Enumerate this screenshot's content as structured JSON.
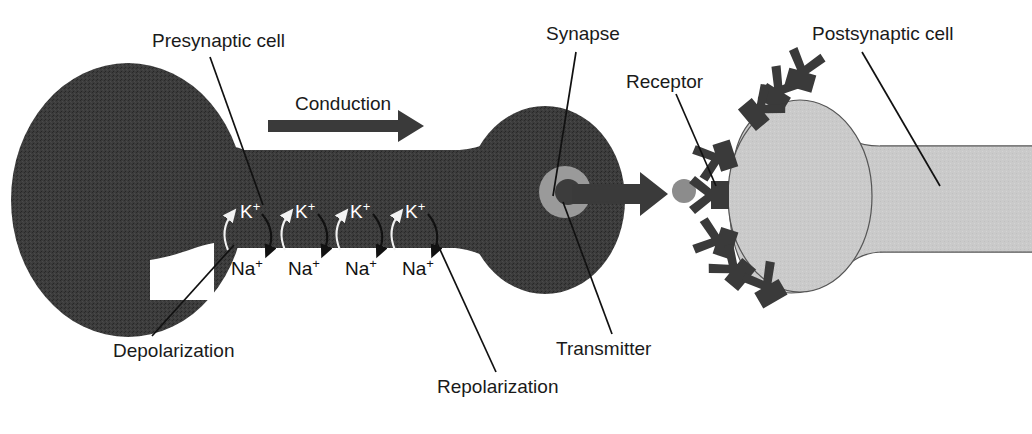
{
  "figure": {
    "background_color": "#ffffff",
    "width": 1032,
    "height": 434
  },
  "labels": {
    "presynaptic_cell": "Presynaptic cell",
    "synapse": "Synapse",
    "receptor": "Receptor",
    "postsynaptic_cell": "Postsynaptic cell",
    "conduction": "Conduction",
    "depolarization": "Depolarization",
    "repolarization": "Repolarization",
    "transmitter": "Transmitter"
  },
  "ions": {
    "potassium_symbol": "K",
    "potassium_charge": "+",
    "sodium_symbol": "Na",
    "sodium_charge": "+",
    "potassium_labels": [
      "K",
      "K",
      "K",
      "K"
    ],
    "sodium_labels": [
      "Na",
      "Na",
      "Na",
      "Na"
    ],
    "pair_count": 4,
    "potassium_direction": "inward-up",
    "sodium_direction": "outward-down"
  },
  "structures": {
    "presynaptic_cell_fill": "#3a3a3a",
    "postsynaptic_cell_fill": "#c9c9c9",
    "vesicle_fill": "#9a9a9a",
    "transmitter_dot_fill": "#8c8c8c",
    "receptor_fill": "#3a3a3a",
    "arrow_fill": "#3a3a3a",
    "receptor_count": 8,
    "vesicle_shape": "c-shape",
    "transmitter_dot_shape": "circle"
  },
  "icons": {
    "conduction_arrow": "right-arrow-icon",
    "release_arrow": "right-arrow-icon",
    "potassium_arrow": "curved-up-arrow-icon",
    "sodium_arrow": "curved-down-arrow-icon",
    "vesicle": "vesicle-icon",
    "receptor": "y-receptor-icon",
    "transmitter_dot": "transmitter-dot-icon"
  }
}
